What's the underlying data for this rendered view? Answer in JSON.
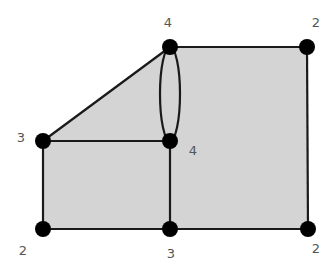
{
  "diagram": {
    "type": "planar-graph",
    "fill_color": "#d4d4d4",
    "edge_color": "#1a1a1a",
    "node_color": "#000000",
    "nodes": [
      {
        "id": "top-mid",
        "x": 170,
        "y": 47,
        "degree": "4",
        "lx": 168,
        "ly": 22
      },
      {
        "id": "top-right",
        "x": 307,
        "y": 47,
        "degree": "2",
        "lx": 316,
        "ly": 22
      },
      {
        "id": "left-mid",
        "x": 43,
        "y": 141,
        "degree": "3",
        "lx": 21,
        "ly": 137
      },
      {
        "id": "center",
        "x": 170,
        "y": 141,
        "degree": "4",
        "lx": 193,
        "ly": 150
      },
      {
        "id": "bottom-left",
        "x": 43,
        "y": 229,
        "degree": "2",
        "lx": 23,
        "ly": 250
      },
      {
        "id": "bottom-mid",
        "x": 170,
        "y": 229,
        "degree": "3",
        "lx": 171,
        "ly": 253
      },
      {
        "id": "bottom-right",
        "x": 308,
        "y": 229,
        "degree": "2",
        "lx": 316,
        "ly": 248
      }
    ],
    "edges": [
      [
        "top-mid",
        "top-right"
      ],
      [
        "top-right",
        "bottom-right"
      ],
      [
        "bottom-right",
        "bottom-mid"
      ],
      [
        "bottom-mid",
        "bottom-left"
      ],
      [
        "bottom-left",
        "left-mid"
      ],
      [
        "left-mid",
        "center"
      ],
      [
        "left-mid",
        "top-mid"
      ],
      [
        "center",
        "bottom-mid"
      ],
      [
        "top-mid",
        "center",
        "curved-left"
      ],
      [
        "top-mid",
        "center",
        "curved-right"
      ]
    ]
  }
}
